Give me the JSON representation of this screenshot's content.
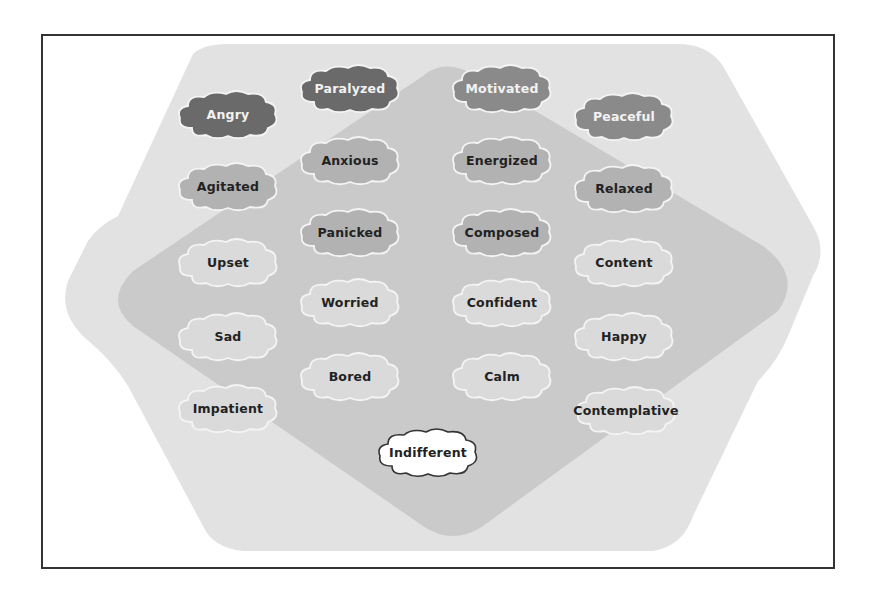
{
  "diagram": {
    "type": "emotion-map",
    "colors": {
      "frame_border": "#333333",
      "hexagon_fill": "#e2e2e2",
      "diamond_fill": "#c8c8c8",
      "tier_dark": "#6a6a6a",
      "tier_dark_alt": "#8a8a8a",
      "tier_mid": "#b2b2b2",
      "tier_light": "#dadada",
      "tier_neutral": "#ffffff",
      "cloud_outline_light": "#f4f4f4",
      "cloud_outline_neutral": "#333333"
    },
    "clouds": [
      {
        "label": "Angry",
        "tier": "dark",
        "x": 174,
        "y": 88
      },
      {
        "label": "Paralyzed",
        "tier": "dark",
        "x": 296,
        "y": 62
      },
      {
        "label": "Motivated",
        "tier": "dark-alt",
        "x": 448,
        "y": 62
      },
      {
        "label": "Peaceful",
        "tier": "dark-alt",
        "x": 570,
        "y": 90
      },
      {
        "label": "Agitated",
        "tier": "mid",
        "x": 174,
        "y": 160
      },
      {
        "label": "Anxious",
        "tier": "mid",
        "x": 296,
        "y": 134
      },
      {
        "label": "Energized",
        "tier": "mid",
        "x": 448,
        "y": 134
      },
      {
        "label": "Relaxed",
        "tier": "mid",
        "x": 570,
        "y": 162
      },
      {
        "label": "Panicked",
        "tier": "mid",
        "x": 296,
        "y": 206
      },
      {
        "label": "Composed",
        "tier": "mid",
        "x": 448,
        "y": 206
      },
      {
        "label": "Upset",
        "tier": "light",
        "x": 174,
        "y": 236
      },
      {
        "label": "Content",
        "tier": "light",
        "x": 570,
        "y": 236
      },
      {
        "label": "Worried",
        "tier": "light",
        "x": 296,
        "y": 276
      },
      {
        "label": "Confident",
        "tier": "light",
        "x": 448,
        "y": 276
      },
      {
        "label": "Sad",
        "tier": "light",
        "x": 174,
        "y": 310
      },
      {
        "label": "Happy",
        "tier": "light",
        "x": 570,
        "y": 310
      },
      {
        "label": "Bored",
        "tier": "light",
        "x": 296,
        "y": 350
      },
      {
        "label": "Calm",
        "tier": "light",
        "x": 448,
        "y": 350
      },
      {
        "label": "Impatient",
        "tier": "light",
        "x": 174,
        "y": 382
      },
      {
        "label": "Contemplative",
        "tier": "light",
        "x": 572,
        "y": 384
      },
      {
        "label": "Indifferent",
        "tier": "neutral",
        "x": 374,
        "y": 426
      }
    ]
  }
}
